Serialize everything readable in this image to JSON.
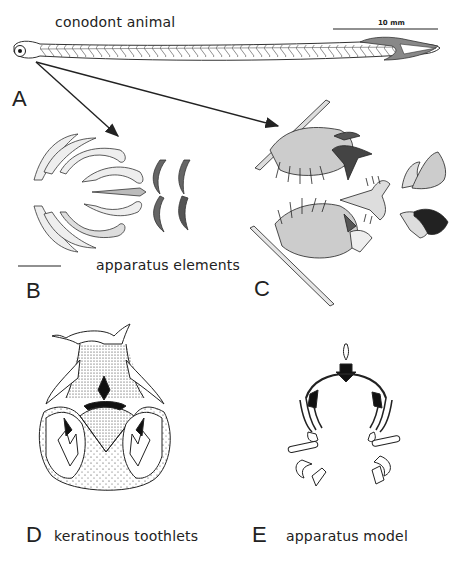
{
  "figure": {
    "panels": [
      {
        "id": "A",
        "letter": "A",
        "caption": "conodont animal"
      },
      {
        "id": "B",
        "letter": "B",
        "caption": "apparatus elements"
      },
      {
        "id": "C",
        "letter": "C",
        "caption": ""
      },
      {
        "id": "D",
        "letter": "D",
        "caption": "keratinous toothlets"
      },
      {
        "id": "E",
        "letter": "E",
        "caption": "apparatus model"
      }
    ],
    "scale_bar": {
      "label": "10 mm"
    },
    "arrows": [
      {
        "from": "A-head",
        "to": "B"
      },
      {
        "from": "A-head",
        "to": "C"
      }
    ]
  }
}
